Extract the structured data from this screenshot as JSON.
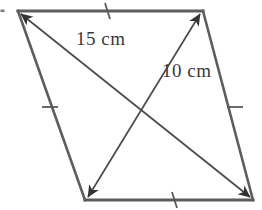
{
  "figure": {
    "kind": "rhombus-with-diagonals",
    "canvas": {
      "width": 262,
      "height": 210
    },
    "colors": {
      "background": "#ffffff",
      "stroke": "#555555",
      "diagonal_stroke": "#4a4a4a",
      "tick_stroke": "#555555",
      "label_text": "#3a3a3a"
    },
    "vertices": [
      {
        "name": "top-left",
        "x": 18,
        "y": 11
      },
      {
        "name": "top-right",
        "x": 203,
        "y": 11
      },
      {
        "name": "bottom-right",
        "x": 253,
        "y": 200
      },
      {
        "name": "bottom-left",
        "x": 85,
        "y": 200
      }
    ],
    "intersection": {
      "x": 142,
      "y": 106
    },
    "sides": [
      {
        "name": "top-side",
        "from": "top-left",
        "to": "top-right",
        "tick_marks": 1,
        "tick": {
          "x": 108,
          "y": 9
        }
      },
      {
        "name": "right-side",
        "from": "top-right",
        "to": "bottom-right",
        "tick_marks": 1,
        "tick": {
          "x": 235,
          "y": 107
        }
      },
      {
        "name": "bottom-side",
        "from": "bottom-right",
        "to": "bottom-left",
        "tick_marks": 1,
        "tick": {
          "x": 175,
          "y": 200
        }
      },
      {
        "name": "left-side",
        "from": "bottom-left",
        "to": "top-left",
        "tick_marks": 1,
        "tick": {
          "x": 50,
          "y": 107
        }
      }
    ],
    "diagonals": [
      {
        "name": "diagonal-long",
        "from": "top-left",
        "to": "bottom-right",
        "arrowheads": "both",
        "label": "15 cm",
        "label_position": {
          "x": 76,
          "y": 28
        }
      },
      {
        "name": "diagonal-short",
        "from": "bottom-left",
        "to": "top-right",
        "arrowheads": "both",
        "label": "10 cm",
        "label_position": {
          "x": 162,
          "y": 60
        }
      }
    ],
    "labels": {
      "diagonal_1": "15 cm",
      "diagonal_2": "10 cm"
    }
  }
}
